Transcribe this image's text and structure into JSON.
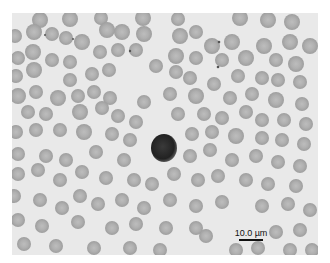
{
  "figure": {
    "type": "blood-smear-micrograph",
    "background_color": "#e9e9e9",
    "rbc_color": "#a9a9a9",
    "leukocyte_color": "#2a2a2a",
    "scale_bar": {
      "label": "10.0 µm",
      "color": "#111111"
    },
    "leukocyte": {
      "label": "lymphocyte",
      "center": [
        164,
        148
      ]
    }
  }
}
